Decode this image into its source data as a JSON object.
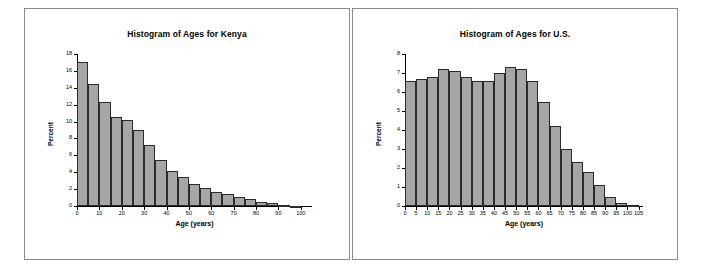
{
  "page": {
    "background": "#ffffff",
    "bar_fill": "#a6a6a6",
    "bar_stroke": "#2b2b2b"
  },
  "panels": [
    {
      "name": "kenya",
      "title": "Histogram of Ages for Kenya"
    },
    {
      "name": "us",
      "title": "Histogram of Ages for U.S."
    }
  ],
  "chart_data": [
    {
      "type": "bar",
      "title": "Histogram of Ages for Kenya",
      "xlabel": "Age (years)",
      "ylabel": "Percent",
      "categories": [
        "0",
        "5",
        "10",
        "15",
        "20",
        "25",
        "30",
        "35",
        "40",
        "45",
        "50",
        "55",
        "60",
        "65",
        "70",
        "75",
        "80",
        "85",
        "90",
        "95",
        "100"
      ],
      "bin_starts": [
        0,
        5,
        10,
        15,
        20,
        25,
        30,
        35,
        40,
        45,
        50,
        55,
        60,
        65,
        70,
        75,
        80,
        85,
        90,
        95
      ],
      "bin_width": 5,
      "values": [
        17.0,
        14.4,
        12.3,
        10.5,
        10.2,
        9.0,
        7.2,
        5.5,
        4.2,
        3.4,
        2.6,
        2.1,
        1.7,
        1.4,
        1.1,
        0.8,
        0.5,
        0.3,
        0.15,
        0.05
      ],
      "xlim": [
        0,
        105
      ],
      "ylim": [
        0,
        18
      ],
      "yticks": [
        "0",
        "2",
        "4",
        "6",
        "8",
        "10",
        "12",
        "14",
        "16",
        "18"
      ],
      "xticks": [
        "0",
        "10",
        "20",
        "30",
        "40",
        "50",
        "60",
        "70",
        "80",
        "90",
        "100"
      ],
      "grid": false,
      "legend": null
    },
    {
      "type": "bar",
      "title": "Histogram of Ages for U.S.",
      "xlabel": "Age (years)",
      "ylabel": "Percent",
      "categories": [
        "0",
        "5",
        "10",
        "15",
        "20",
        "25",
        "30",
        "35",
        "40",
        "45",
        "50",
        "55",
        "60",
        "65",
        "70",
        "75",
        "80",
        "85",
        "90",
        "95",
        "100",
        "105"
      ],
      "bin_starts": [
        0,
        5,
        10,
        15,
        20,
        25,
        30,
        35,
        40,
        45,
        50,
        55,
        60,
        65,
        70,
        75,
        80,
        85,
        90,
        95,
        100
      ],
      "bin_width": 5,
      "values": [
        6.6,
        6.7,
        6.8,
        7.2,
        7.1,
        6.8,
        6.6,
        6.6,
        7.0,
        7.3,
        7.2,
        6.6,
        5.5,
        4.2,
        3.0,
        2.3,
        1.8,
        1.1,
        0.5,
        0.15,
        0.05
      ],
      "xlim": [
        0,
        107
      ],
      "ylim": [
        0,
        8
      ],
      "yticks": [
        "0",
        "1",
        "2",
        "3",
        "4",
        "5",
        "6",
        "7",
        "8"
      ],
      "xticks": [
        "0",
        "5",
        "10",
        "15",
        "20",
        "25",
        "30",
        "35",
        "40",
        "45",
        "50",
        "55",
        "60",
        "65",
        "70",
        "75",
        "80",
        "85",
        "90",
        "95",
        "100",
        "105"
      ],
      "grid": false,
      "legend": null
    }
  ]
}
